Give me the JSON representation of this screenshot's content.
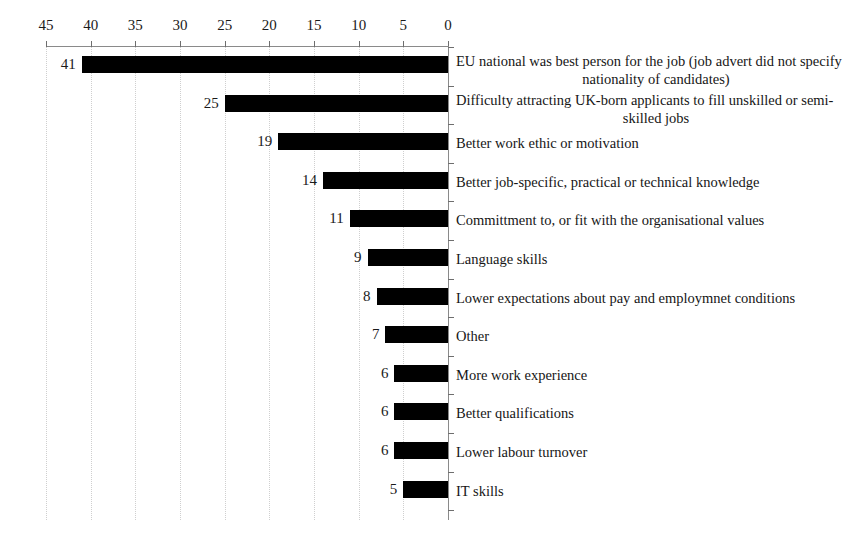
{
  "chart_data": {
    "type": "bar",
    "orientation": "horizontal",
    "title": "",
    "subtitle": "",
    "xlabel": "",
    "ylabel": "",
    "xlim": [
      45,
      0
    ],
    "x_axis_reversed": true,
    "x_axis_position": "top",
    "y_axis_position": "right",
    "grid": true,
    "grid_orientation": "vertical",
    "grid_style": "dotted",
    "legend": false,
    "legend_position": "none",
    "bar_color": "#000000",
    "grid_color": "#cfcfcf",
    "axis_color": "#8a8a8a",
    "tick_labels": [
      "45",
      "40",
      "35",
      "30",
      "25",
      "20",
      "15",
      "10",
      "5",
      "0"
    ],
    "tick_values": [
      45,
      40,
      35,
      30,
      25,
      20,
      15,
      10,
      5,
      0
    ],
    "categories": [
      "EU national was best person for the job (job advert did not specify nationality of candidates)",
      "Difficulty attracting UK-born applicants to fill unskilled or semi-skilled jobs",
      "Better work ethic or motivation",
      "Better job-specific, practical or technical knowledge",
      "Committment to, or fit with the organisational values",
      "Language skills",
      "Lower expectations about pay and employmnet conditions",
      "Other",
      "More work experience",
      "Better qualifications",
      "Lower labour turnover",
      "IT skills"
    ],
    "values": [
      41,
      25,
      19,
      14,
      11,
      9,
      8,
      7,
      6,
      6,
      6,
      5
    ],
    "value_labels": [
      "41",
      "25",
      "19",
      "14",
      "11",
      "9",
      "8",
      "7",
      "6",
      "6",
      "6",
      "5"
    ],
    "bars": [
      {
        "value": 41,
        "value_label": "41",
        "label_line1": "EU national was best person for the job (job advert did not specify",
        "label_line2": "nationality of candidates)",
        "two_line": true
      },
      {
        "value": 25,
        "value_label": "25",
        "label_line1": "Difficulty attracting UK-born applicants to fill unskilled or semi-",
        "label_line2": "skilled jobs",
        "two_line": true
      },
      {
        "value": 19,
        "value_label": "19",
        "label_line1": "Better work ethic or motivation",
        "label_line2": "",
        "two_line": false
      },
      {
        "value": 14,
        "value_label": "14",
        "label_line1": "Better job-specific, practical or technical knowledge",
        "label_line2": "",
        "two_line": false
      },
      {
        "value": 11,
        "value_label": "11",
        "label_line1": "Committment to, or fit with the organisational values",
        "label_line2": "",
        "two_line": false
      },
      {
        "value": 9,
        "value_label": "9",
        "label_line1": "Language skills",
        "label_line2": "",
        "two_line": false
      },
      {
        "value": 8,
        "value_label": "8",
        "label_line1": "Lower expectations about pay and employmnet conditions",
        "label_line2": "",
        "two_line": false
      },
      {
        "value": 7,
        "value_label": "7",
        "label_line1": "Other",
        "label_line2": "",
        "two_line": false
      },
      {
        "value": 6,
        "value_label": "6",
        "label_line1": "More work experience",
        "label_line2": "",
        "two_line": false
      },
      {
        "value": 6,
        "value_label": "6",
        "label_line1": "Better qualifications",
        "label_line2": "",
        "two_line": false
      },
      {
        "value": 6,
        "value_label": "6",
        "label_line1": "Lower labour turnover",
        "label_line2": "",
        "two_line": false
      },
      {
        "value": 5,
        "value_label": "5",
        "label_line1": "IT skills",
        "label_line2": "",
        "two_line": false
      }
    ]
  }
}
